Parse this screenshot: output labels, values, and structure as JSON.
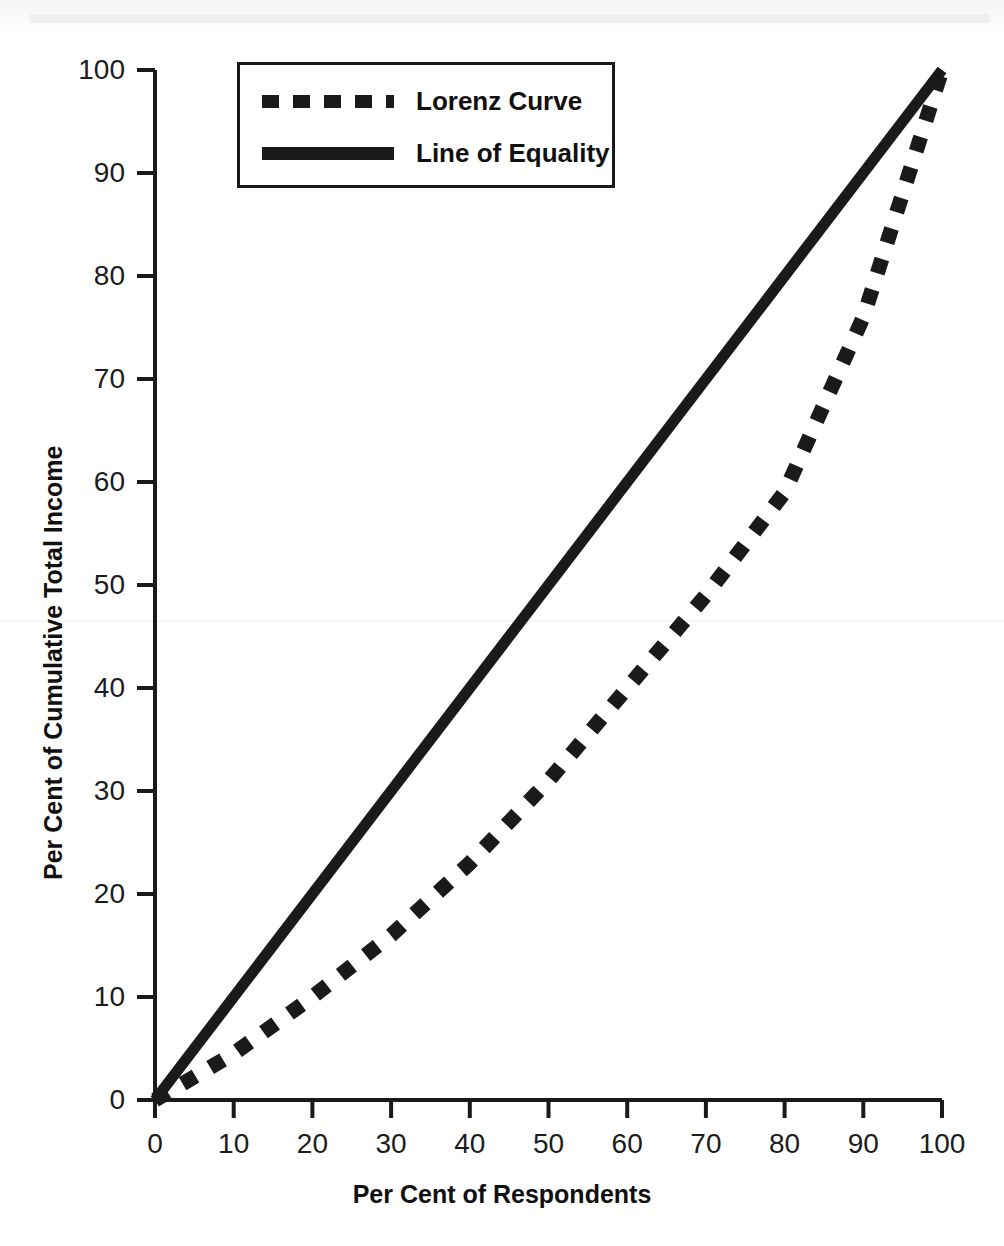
{
  "chart_data": {
    "type": "line",
    "title": "",
    "xlabel": "Per Cent of Respondents",
    "ylabel": "Per Cent of Cumulative Total Income",
    "xlim": [
      0,
      100
    ],
    "ylim": [
      0,
      100
    ],
    "xticks": [
      "0",
      "10",
      "20",
      "30",
      "40",
      "50",
      "60",
      "70",
      "80",
      "90",
      "100"
    ],
    "yticks": [
      "0",
      "10",
      "20",
      "30",
      "40",
      "50",
      "60",
      "70",
      "80",
      "90",
      "100"
    ],
    "grid": false,
    "legend_position": "top-left-inside",
    "series": [
      {
        "name": "Lorenz Curve",
        "style": "dashed",
        "color": "#1a1a1a",
        "x": [
          0,
          10,
          20,
          30,
          40,
          50,
          60,
          70,
          80,
          90,
          100
        ],
        "values": [
          0,
          4.5,
          10,
          16,
          23,
          31,
          40,
          49,
          59,
          76,
          100
        ]
      },
      {
        "name": "Line of Equality",
        "style": "solid",
        "color": "#1a1a1a",
        "x": [
          0,
          100
        ],
        "values": [
          0,
          100
        ]
      }
    ]
  },
  "legend": {
    "items": [
      {
        "label": "Lorenz Curve",
        "style": "dashed"
      },
      {
        "label": "Line of Equality",
        "style": "solid"
      }
    ]
  },
  "axes": {
    "x_title": "Per Cent of Respondents",
    "y_title": "Per Cent of Cumulative Total Income"
  },
  "geometry": {
    "plot_left": 155,
    "plot_right": 942,
    "plot_top": 70,
    "plot_bottom": 1100
  }
}
